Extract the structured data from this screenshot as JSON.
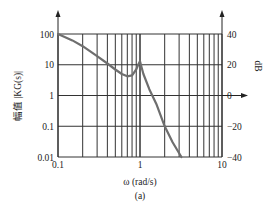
{
  "chart_data": {
    "type": "line",
    "title": "",
    "caption": "(a)",
    "xlabel": "ω (rad/s)",
    "ylabel": "幅值 |KG(s)|",
    "ylabel_right": "dB",
    "xscale": "log",
    "yscale": "log",
    "xlim": [
      0.1,
      10
    ],
    "ylim": [
      0.01,
      100
    ],
    "ylim_right_db": [
      -40,
      40
    ],
    "grid": true,
    "x_ticks": [
      "0.1",
      "1",
      "10"
    ],
    "y_ticks": [
      "100",
      "10",
      "1",
      "0.1",
      "0.01"
    ],
    "y_ticks_right": [
      "40",
      "20",
      "0",
      "−20",
      "−40"
    ],
    "series": [
      {
        "name": "|KG(jω)|",
        "color": "#6e6e6e",
        "x": [
          0.1,
          0.15,
          0.2,
          0.3,
          0.4,
          0.5,
          0.6,
          0.7,
          0.8,
          0.9,
          0.95,
          1.0,
          1.05,
          1.1,
          1.3,
          1.6,
          2.0,
          2.5,
          3.2
        ],
        "y": [
          100,
          62,
          40,
          19,
          11,
          7,
          5,
          4.2,
          4.5,
          7,
          10,
          13,
          8,
          5,
          1.6,
          0.5,
          0.1,
          0.03,
          0.01
        ]
      }
    ]
  }
}
